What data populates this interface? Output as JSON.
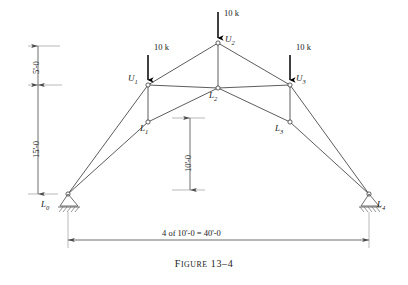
{
  "figure": {
    "caption_prefix": "F",
    "caption_word": "IGURE",
    "caption_number": "13–4",
    "caption_full": "Figure 13–4"
  },
  "loads": [
    {
      "id": "load-u1",
      "label": "10 k",
      "x": 151,
      "y": 58
    },
    {
      "id": "load-u2",
      "label": "10 k",
      "x": 225,
      "y": 14
    },
    {
      "id": "load-u3",
      "label": "10 k",
      "x": 297,
      "y": 58
    }
  ],
  "nodes": [
    {
      "id": "L0",
      "label": "L",
      "sub": "0",
      "x": 68,
      "y": 194
    },
    {
      "id": "U1",
      "label": "U",
      "sub": "1",
      "x": 148,
      "y": 85
    },
    {
      "id": "L1",
      "label": "L",
      "sub": "1",
      "x": 148,
      "y": 122
    },
    {
      "id": "U2",
      "label": "U",
      "sub": "2",
      "x": 218,
      "y": 43
    },
    {
      "id": "L2",
      "label": "L",
      "sub": "2",
      "x": 218,
      "y": 88
    },
    {
      "id": "U3",
      "label": "U",
      "sub": "3",
      "x": 290,
      "y": 85
    },
    {
      "id": "L3",
      "label": "L",
      "sub": "3",
      "x": 290,
      "y": 122
    },
    {
      "id": "L4",
      "label": "L",
      "sub": "4",
      "x": 369,
      "y": 194
    }
  ],
  "dimensions": {
    "left_upper": "5'-0",
    "left_lower": "15'-0",
    "center_vertical": "10'-0",
    "bottom_span": "4 of 10'-0 = 40'-0"
  },
  "colors": {
    "line": "#4a4a4a",
    "load_arrow": "#000000",
    "text": "#1a1a1a",
    "dimension_line": "#6b6b6b"
  }
}
